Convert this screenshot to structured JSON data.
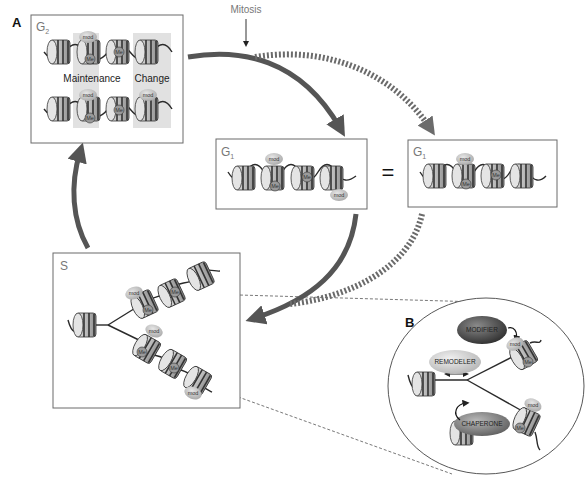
{
  "figure": {
    "panel_a_label": "A",
    "panel_b_label": "B",
    "mitosis_label": "Mitosis",
    "equals_sign": "="
  },
  "g2_box": {
    "phase": "G",
    "phase_sub": "2",
    "maintenance_label": "Maintenance",
    "change_label": "Change",
    "mod_label": "mod",
    "me_label": "Me"
  },
  "g1_box_middle": {
    "phase": "G",
    "phase_sub": "1",
    "mod_label": "mod",
    "me_label": "Me"
  },
  "g1_box_right": {
    "phase": "G",
    "phase_sub": "1",
    "mod_label": "mod",
    "me_label": "Me"
  },
  "s_box": {
    "phase": "S",
    "mod_label": "mod",
    "me_label": "Me"
  },
  "panel_b": {
    "modifier_label": "MODIFIER",
    "remodeler_label": "REMODELER",
    "chaperone_label": "CHAPERONE",
    "mod_label": "mod",
    "me_label": "Me"
  },
  "colors": {
    "arrow": "#555555",
    "box_border": "#6a6a6a",
    "modifier_fill": "#4a4a4a",
    "remodeler_fill": "#cfcfcf",
    "chaperone_fill": "#8a8a8a",
    "mod_fill": "#c8c8c8"
  }
}
